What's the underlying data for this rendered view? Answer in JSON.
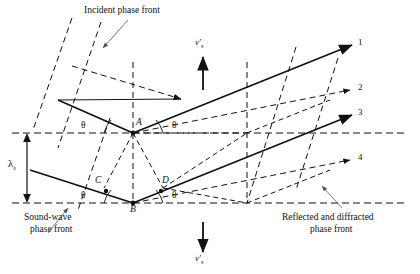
{
  "figure": {
    "type": "acousto-optic-bragg-diffraction-diagram",
    "captions": {
      "incident": "Incident phase front",
      "sound_wave_line1": "Sound-wave",
      "sound_wave_line2": "phase front",
      "reflected_line1": "Reflected and diffracted",
      "reflected_line2": "phase front"
    },
    "points": [
      {
        "id": "A",
        "label": "A",
        "x": 133,
        "y": 133
      },
      {
        "id": "B",
        "label": "B",
        "x": 133,
        "y": 203
      },
      {
        "id": "C",
        "label": "C",
        "x": 104,
        "y": 185
      },
      {
        "id": "D",
        "label": "D",
        "x": 161,
        "y": 185
      }
    ],
    "angles": [
      {
        "label": "θ",
        "at": "upper-left"
      },
      {
        "label": "θ",
        "at": "upper-right"
      },
      {
        "label": "θ",
        "at": "lower-left"
      },
      {
        "label": "θ",
        "at": "lower-right"
      }
    ],
    "velocity": {
      "up_symbol": "v",
      "up_prime": "′",
      "up_subscript": "s",
      "down_symbol": "v",
      "down_prime": "′",
      "down_subscript": "s"
    },
    "wavelength": {
      "symbol": "λ",
      "subscript": "s"
    },
    "rays": [
      {
        "number": "1",
        "style": "solid"
      },
      {
        "number": "2",
        "style": "dashed"
      },
      {
        "number": "3",
        "style": "solid"
      },
      {
        "number": "4",
        "style": "dashed"
      }
    ],
    "colors": {
      "line": "#111111",
      "background": "#ffffff"
    }
  }
}
